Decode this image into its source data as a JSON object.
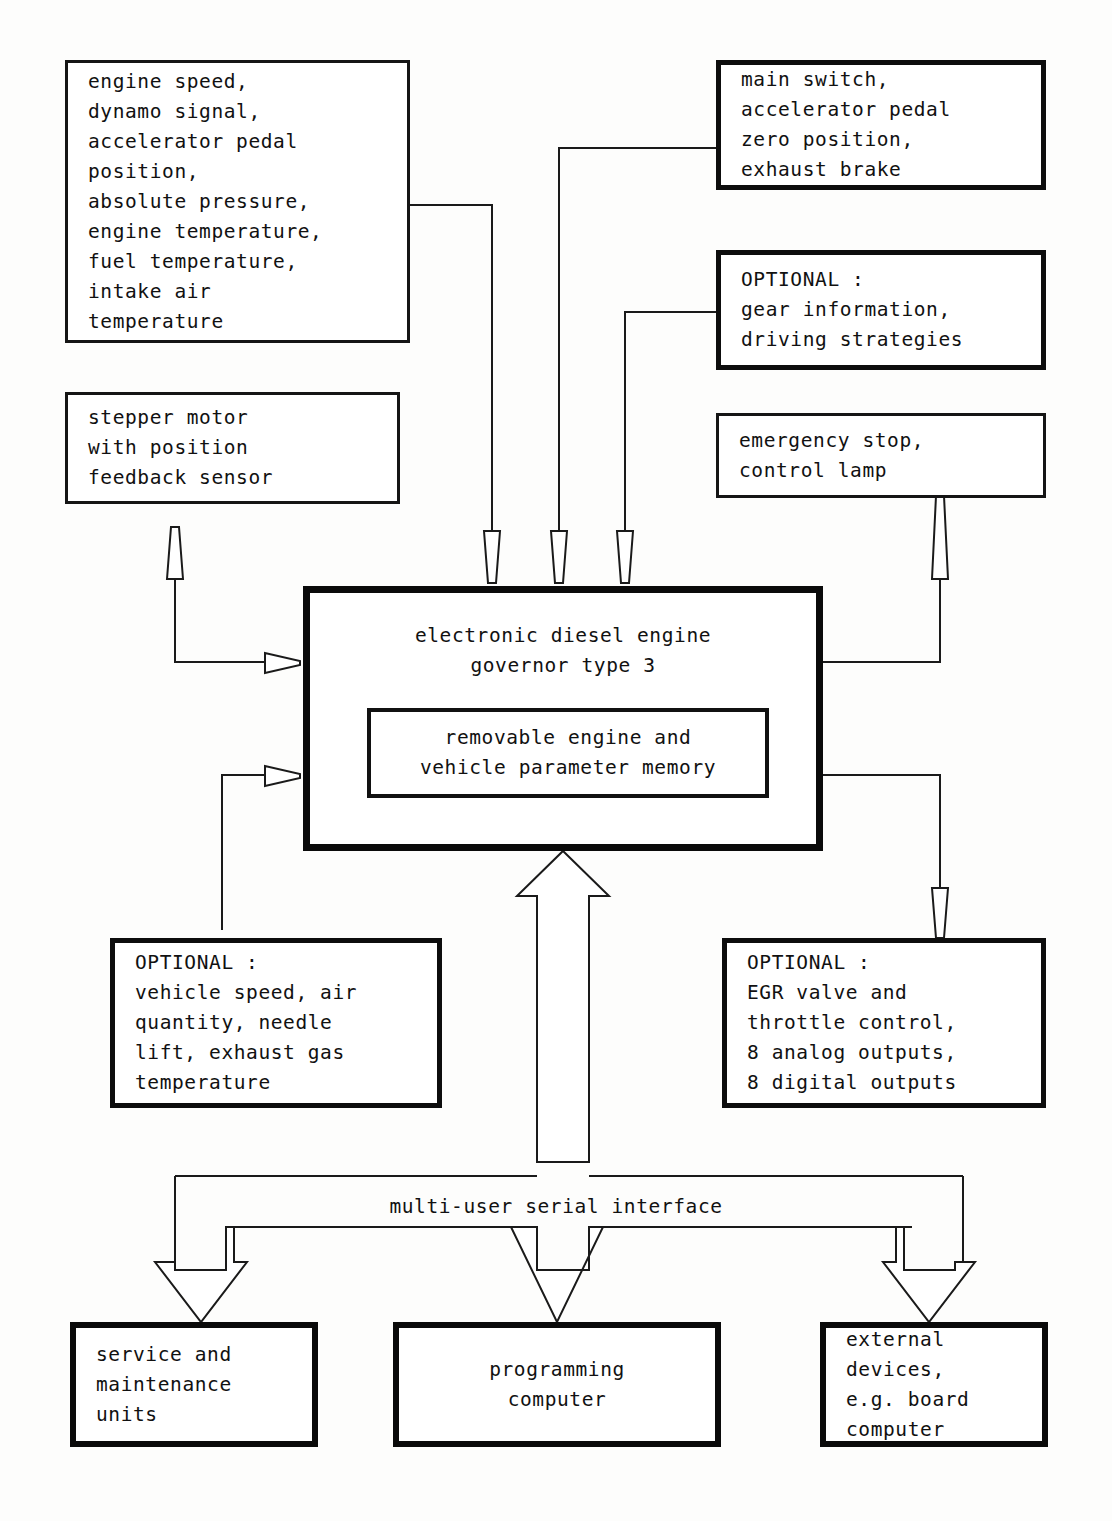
{
  "diagram": {
    "bus_label": "multi-user serial interface",
    "nodes": {
      "engine_sensors": "engine speed,\ndynamo signal,\naccelerator pedal\nposition,\nabsolute pressure,\nengine temperature,\nfuel temperature,\nintake air\ntemperature",
      "main_switch": "main switch,\naccelerator pedal\nzero position,\nexhaust brake",
      "optional_gear": "OPTIONAL :\ngear information,\ndriving strategies",
      "stepper_motor": "stepper motor\nwith position\nfeedback sensor",
      "emergency_stop": "emergency stop,\ncontrol lamp",
      "central_title": "electronic diesel engine\ngovernor type 3",
      "memory": "removable engine and\nvehicle parameter memory",
      "optional_vehicle": "OPTIONAL :\nvehicle speed, air\nquantity, needle\nlift, exhaust gas\ntemperature",
      "optional_egr": "OPTIONAL :\nEGR valve and\nthrottle control,\n8 analog outputs,\n8 digital outputs",
      "service_units": "service and\nmaintenance\nunits",
      "programming_computer": "programming\ncomputer",
      "external_devices": "external\ndevices,\ne.g. board\ncomputer"
    },
    "colors": {
      "line": "#1a1a1a",
      "box_border": "#151515",
      "text": "#111111",
      "background": "#fdfdfc"
    }
  }
}
